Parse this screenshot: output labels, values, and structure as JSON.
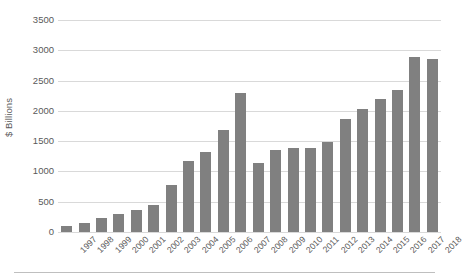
{
  "chart_data": {
    "type": "bar",
    "title": "",
    "subtitle": "",
    "xlabel": "",
    "ylabel": "$ Billions",
    "ylim": [
      0,
      3500
    ],
    "ytick_step": 500,
    "yticks": [
      0,
      500,
      1000,
      1500,
      2000,
      2500,
      3000,
      3500
    ],
    "ytick_labels": [
      "0",
      "500",
      "1000",
      "1500",
      "2000",
      "2500",
      "3000",
      "3500"
    ],
    "grid": true,
    "grid_axis": "y",
    "legend": false,
    "legend_position": "none",
    "categories": [
      "1997",
      "1998",
      "1999",
      "2000",
      "2001",
      "2002",
      "2003",
      "2004",
      "2005",
      "2006",
      "2007",
      "2008",
      "2009",
      "2010",
      "2011",
      "2012",
      "2013",
      "2014",
      "2015",
      "2016",
      "2017",
      "2018"
    ],
    "values": [
      100,
      150,
      230,
      290,
      370,
      450,
      780,
      1170,
      1320,
      1680,
      2300,
      1140,
      1360,
      1390,
      1390,
      1480,
      1870,
      2030,
      2200,
      2350,
      2890,
      2850
    ],
    "series": [
      {
        "name": "",
        "color": "#808080",
        "values": [
          100,
          150,
          230,
          290,
          370,
          450,
          780,
          1170,
          1320,
          1680,
          2300,
          1140,
          1360,
          1390,
          1390,
          1480,
          1870,
          2030,
          2200,
          2350,
          2890,
          2850
        ]
      }
    ],
    "annotations": []
  },
  "style": {
    "bar_color": "#808080",
    "gridline_color": "#d9d9d9",
    "text_color": "#595959",
    "rule_color": "#bfbfbf",
    "background": "#ffffff"
  }
}
